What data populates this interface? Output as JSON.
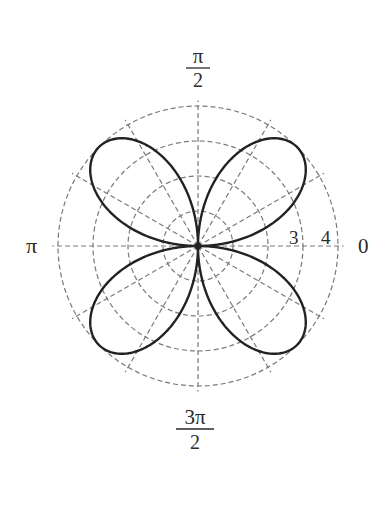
{
  "chart_data": {
    "type": "line",
    "subtype": "polar",
    "title": "",
    "equation": "r = 4 sin(2θ)",
    "series": [
      {
        "name": "four-petaled rose",
        "function": "4*sin(2*theta)",
        "theta_range": [
          0,
          6.283185307
        ],
        "petal_count": 4,
        "petal_angles_deg": [
          45,
          135,
          225,
          315
        ],
        "max_r": 4
      }
    ],
    "radial_ticks": [
      1,
      2,
      3,
      4
    ],
    "radial_tick_labels": [
      {
        "value": 3,
        "label": "3"
      },
      {
        "value": 4,
        "label": "4"
      }
    ],
    "angle_gridlines_deg": [
      0,
      30,
      60,
      90,
      120,
      150,
      180,
      210,
      240,
      270,
      300,
      330
    ],
    "angle_labels": [
      {
        "angle": "0",
        "label": "0"
      },
      {
        "angle": "pi/2",
        "label_num": "π",
        "label_den": "2"
      },
      {
        "angle": "pi",
        "label": "π"
      },
      {
        "angle": "3pi/2",
        "label_num": "3π",
        "label_den": "2"
      }
    ],
    "rlim": [
      0,
      4
    ],
    "grid": true,
    "grid_style": "dashed",
    "legend": null
  },
  "style": {
    "curve_color": "#222222",
    "grid_color": "#7a7a7a",
    "label_color": "#2a2a2a",
    "background": "#ffffff"
  },
  "labels": {
    "right": "0",
    "left": "π",
    "top_num": "π",
    "top_den": "2",
    "bottom_num": "3π",
    "bottom_den": "2",
    "r3": "3",
    "r4": "4"
  }
}
